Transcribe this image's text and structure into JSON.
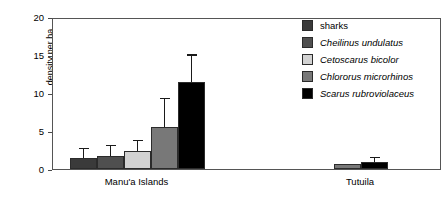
{
  "chart_data": {
    "type": "bar",
    "title": "",
    "xlabel": "",
    "ylabel": "density per ha",
    "ylim": [
      0,
      20
    ],
    "yticks": [
      0,
      5,
      10,
      15,
      20
    ],
    "grid": false,
    "legend_position": "top-right",
    "categories": [
      "Manu'a Islands",
      "Tutuila"
    ],
    "series": [
      {
        "name": "sharks",
        "italic": false,
        "color": "#3a3a3a",
        "values": [
          1.4,
          0.0
        ],
        "errors": [
          1.2,
          0.0
        ]
      },
      {
        "name": "Cheilinus undulatus",
        "italic": true,
        "color": "#4f4f4f",
        "values": [
          1.7,
          0.0
        ],
        "errors": [
          1.3,
          0.0
        ]
      },
      {
        "name": "Cetoscarus bicolor",
        "italic": true,
        "color": "#d2d2d2",
        "values": [
          2.4,
          0.0
        ],
        "errors": [
          1.3,
          0.0
        ]
      },
      {
        "name": "Chlororus microrhinos",
        "italic": true,
        "color": "#787878",
        "values": [
          5.5,
          0.7
        ],
        "errors": [
          3.7,
          0.0
        ]
      },
      {
        "name": "Scarus rubroviolaceus",
        "italic": true,
        "color": "#000000",
        "values": [
          11.5,
          0.9
        ],
        "errors": [
          3.4,
          0.5
        ]
      }
    ]
  },
  "axis": {
    "ylabel": "density per ha",
    "ytick_labels": [
      "20",
      "15",
      "10",
      "5",
      "0"
    ],
    "group_labels": [
      "Manu'a Islands",
      "Tutuila"
    ]
  },
  "legend": {
    "items": [
      {
        "label": "sharks"
      },
      {
        "label": "Cheilinus undulatus"
      },
      {
        "label": "Cetoscarus bicolor"
      },
      {
        "label": "Chlororus microrhinos"
      },
      {
        "label": "Scarus rubroviolaceus"
      }
    ]
  }
}
